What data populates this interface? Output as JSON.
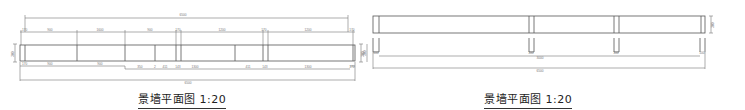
{
  "drawings": [
    {
      "id": "left",
      "title": "景墙平面图 1:20",
      "dimensions": {
        "top_overall": "6500",
        "top_row": [
          "170",
          "900",
          "1600",
          "900",
          "170",
          "1200",
          "170",
          "1200",
          "170"
        ],
        "bottom_row": [
          "170",
          "900",
          "900",
          "350",
          "2",
          "411",
          "143",
          "1300",
          "411",
          "143",
          "1300",
          "170"
        ],
        "bottom_overall": "6500",
        "left_height": "300",
        "right_height": "300"
      }
    },
    {
      "id": "right",
      "title": "景墙平面图 1:20",
      "dimensions": {
        "left_height": "300",
        "post_labels": [
          "100",
          "100",
          "100",
          "100"
        ],
        "inner_run": "3000",
        "bottom_overall": "6500",
        "right_height": "300"
      }
    }
  ],
  "colors": {
    "line": "#555555",
    "text": "#222222",
    "background": "#ffffff"
  }
}
